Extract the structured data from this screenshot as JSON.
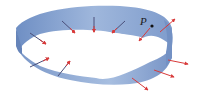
{
  "figure": {
    "point_label": "P",
    "colors": {
      "strip_light": "#a9c0e0",
      "strip_mid": "#8aa6d2",
      "strip_dark": "#6c8cc0",
      "arrow": "#d83a3a",
      "point": "#111111"
    },
    "arrow_count": 13
  }
}
